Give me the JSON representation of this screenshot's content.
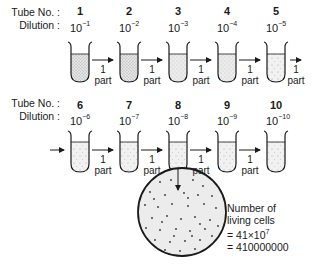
{
  "labels": {
    "tube_no": "Tube No. :",
    "dilution": "Dilution :",
    "transfer_top": "1",
    "transfer_bottom": "part"
  },
  "rows": [
    {
      "tubes": [
        {
          "number": "1",
          "dilution_base": "10",
          "dilution_exp": "−1",
          "fill": "dense"
        },
        {
          "number": "2",
          "dilution_base": "10",
          "dilution_exp": "−2",
          "fill": "dense"
        },
        {
          "number": "3",
          "dilution_base": "10",
          "dilution_exp": "−3",
          "fill": "medium"
        },
        {
          "number": "4",
          "dilution_base": "10",
          "dilution_exp": "−4",
          "fill": "medium"
        },
        {
          "number": "5",
          "dilution_base": "10",
          "dilution_exp": "−5",
          "fill": "sparse"
        }
      ]
    },
    {
      "tubes": [
        {
          "number": "6",
          "dilution_base": "10",
          "dilution_exp": "−6",
          "fill": "sparse"
        },
        {
          "number": "7",
          "dilution_base": "10",
          "dilution_exp": "−7",
          "fill": "sparse"
        },
        {
          "number": "8",
          "dilution_base": "10",
          "dilution_exp": "−8",
          "fill": "sparse"
        },
        {
          "number": "9",
          "dilution_base": "10",
          "dilution_exp": "−9",
          "fill": "sparse"
        },
        {
          "number": "10",
          "dilution_base": "10",
          "dilution_exp": "−10",
          "fill": "sparse"
        }
      ]
    }
  ],
  "plate": {
    "source_tube": "8",
    "result_line1": "Number of",
    "result_line2": "living cells",
    "result_line3_prefix": "= 41×10",
    "result_line3_exp": "7",
    "result_line4": "= 410000000"
  }
}
